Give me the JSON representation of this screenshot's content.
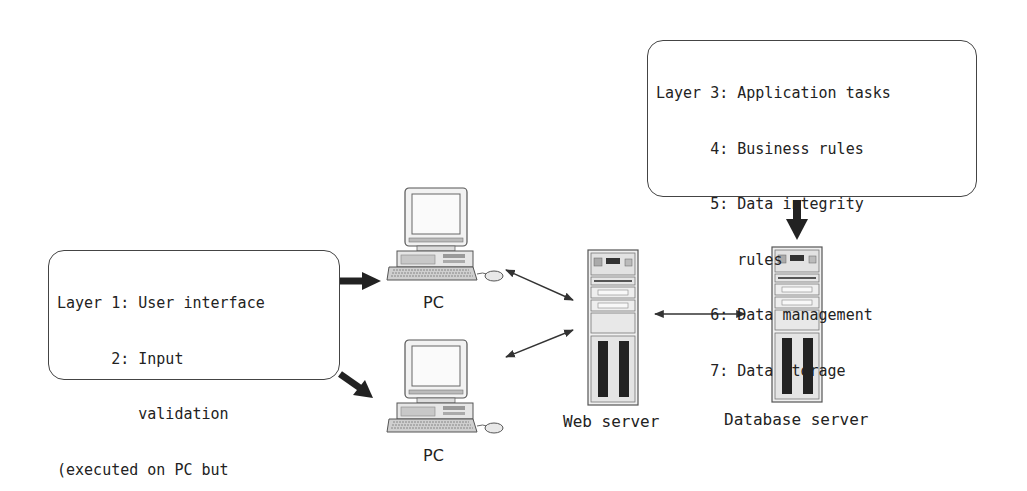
{
  "diagram": {
    "type": "three-tier client-server architecture",
    "boxes": {
      "client_layers": {
        "lines": [
          "Layer 1: User interface",
          "      2: Input",
          "         validation",
          "(executed on PC but",
          "stored on web server)"
        ]
      },
      "server_layers": {
        "lines": [
          "Layer 3: Application tasks",
          "      4: Business rules",
          "      5: Data integrity",
          "         rules",
          "      6: Data management",
          "      7: Data storage"
        ]
      }
    },
    "nodes": {
      "pc_top": {
        "label": "PC",
        "icon": "desktop-computer-icon"
      },
      "pc_bottom": {
        "label": "PC",
        "icon": "desktop-computer-icon"
      },
      "web_server": {
        "label": "Web server",
        "icon": "tower-server-icon"
      },
      "database_server": {
        "label": "Database server",
        "icon": "tower-server-icon"
      }
    },
    "edges": [
      {
        "from": "client_layers",
        "to": "pc_top",
        "style": "thick-arrow"
      },
      {
        "from": "client_layers",
        "to": "pc_bottom",
        "style": "thick-arrow"
      },
      {
        "from": "pc_top",
        "to": "web_server",
        "style": "thin-double-arrow"
      },
      {
        "from": "pc_bottom",
        "to": "web_server",
        "style": "thin-double-arrow"
      },
      {
        "from": "web_server",
        "to": "database_server",
        "style": "thin-double-arrow"
      },
      {
        "from": "server_layers",
        "to": "database_server",
        "style": "thick-arrow"
      }
    ],
    "colors": {
      "stroke": "#333333",
      "fill": "#e8e8e8",
      "background": "#ffffff"
    }
  }
}
